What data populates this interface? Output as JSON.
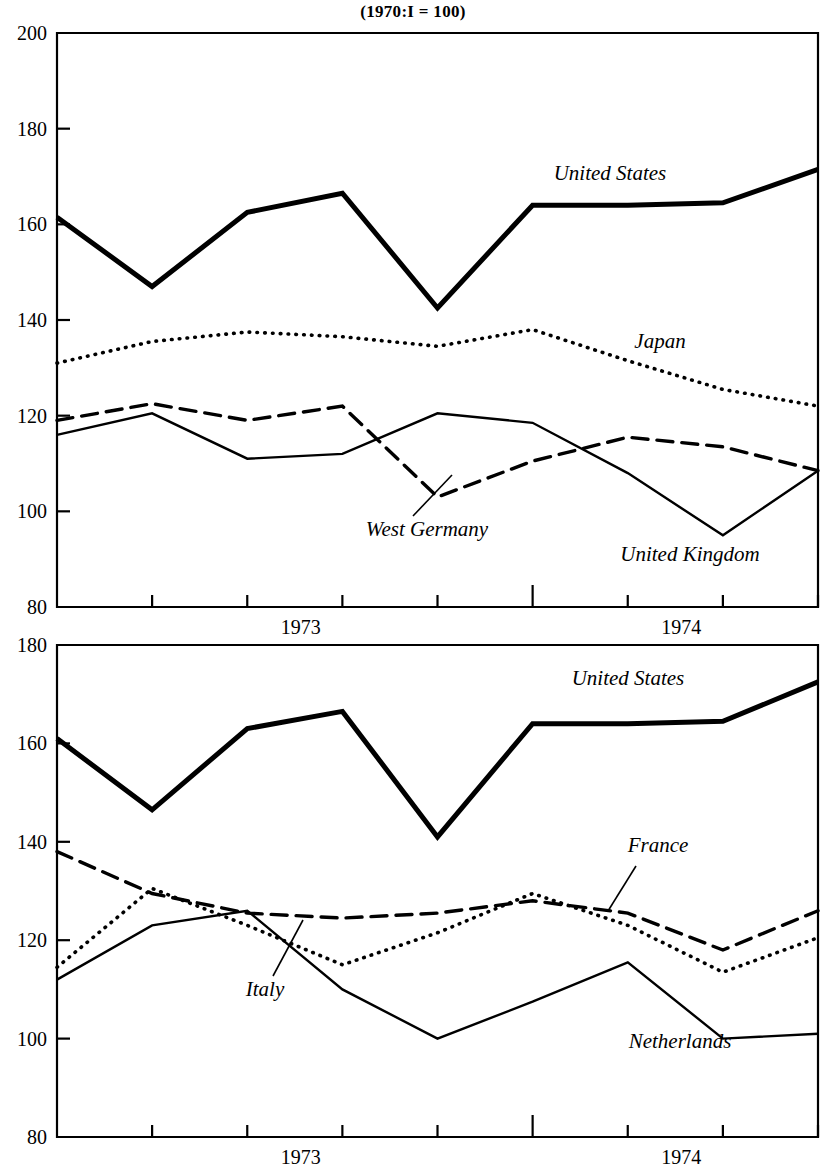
{
  "title": "(1970:I  =  100)",
  "colors": {
    "ink": "#000000",
    "background": "#ffffff"
  },
  "axis": {
    "year_1973": "1973",
    "year_1974": "1974"
  },
  "panels": [
    {
      "name": "top-panel",
      "ylim": [
        80,
        200
      ],
      "yticks": [
        "80",
        "100",
        "120",
        "140",
        "160",
        "180",
        "200"
      ],
      "xticks": [
        "1973",
        "1974"
      ],
      "series_labels": {
        "united_states": "United States",
        "japan": "Japan",
        "west_germany": "West Germany",
        "united_kingdom": "United Kingdom"
      }
    },
    {
      "name": "bottom-panel",
      "ylim": [
        80,
        180
      ],
      "yticks": [
        "80",
        "100",
        "120",
        "140",
        "160",
        "180"
      ],
      "xticks": [
        "1973",
        "1974"
      ],
      "series_labels": {
        "united_states": "United States",
        "france": "France",
        "italy": "Italy",
        "netherlands": "Netherlands"
      }
    }
  ],
  "chart_data": [
    {
      "type": "line",
      "title": "(1970:I  =  100)",
      "subtitle": "Top panel: United States, Japan, West Germany, United Kingdom",
      "xlabel": "",
      "ylabel": "",
      "ylim": [
        80,
        200
      ],
      "yticks": [
        80,
        100,
        120,
        140,
        160,
        180,
        200
      ],
      "grid": false,
      "legend": "inline-annotations",
      "x": [
        "1972:IV",
        "1973:I",
        "1973:II",
        "1973:III",
        "1973:IV",
        "1974:I",
        "1974:II",
        "1974:III",
        "1974:IV"
      ],
      "xtick_labels": [
        "1973",
        "1974"
      ],
      "series": [
        {
          "name": "United States",
          "style": "solid-thick",
          "values": [
            161.5,
            147.0,
            162.5,
            166.5,
            142.5,
            164.0,
            164.0,
            164.5,
            171.5
          ]
        },
        {
          "name": "Japan",
          "style": "dotted",
          "values": [
            131.0,
            135.5,
            137.5,
            136.5,
            134.5,
            138.0,
            131.5,
            125.5,
            122.0
          ]
        },
        {
          "name": "West Germany",
          "style": "dashed",
          "values": [
            119.0,
            122.5,
            119.0,
            122.0,
            103.0,
            110.5,
            115.5,
            113.5,
            108.5
          ]
        },
        {
          "name": "United Kingdom",
          "style": "solid-thin",
          "values": [
            116.0,
            120.5,
            111.0,
            112.0,
            120.5,
            118.5,
            108.0,
            95.0,
            108.5
          ]
        }
      ]
    },
    {
      "type": "line",
      "title": "",
      "subtitle": "Bottom panel: United States, France, Italy, Netherlands",
      "xlabel": "",
      "ylabel": "",
      "ylim": [
        80,
        180
      ],
      "yticks": [
        80,
        100,
        120,
        140,
        160,
        180
      ],
      "grid": false,
      "legend": "inline-annotations",
      "x": [
        "1972:IV",
        "1973:I",
        "1973:II",
        "1973:III",
        "1973:IV",
        "1974:I",
        "1974:II",
        "1974:III",
        "1974:IV"
      ],
      "xtick_labels": [
        "1973",
        "1974"
      ],
      "series": [
        {
          "name": "United States",
          "style": "solid-thick",
          "values": [
            161.0,
            146.5,
            163.0,
            166.5,
            141.0,
            164.0,
            164.0,
            164.5,
            172.5
          ]
        },
        {
          "name": "France",
          "style": "dashed",
          "values": [
            138.0,
            129.5,
            125.5,
            124.5,
            125.5,
            128.0,
            125.5,
            118.0,
            126.0
          ]
        },
        {
          "name": "Italy",
          "style": "dotted",
          "values": [
            114.5,
            130.5,
            123.0,
            115.0,
            121.5,
            129.5,
            123.0,
            113.5,
            120.5
          ]
        },
        {
          "name": "Netherlands",
          "style": "solid-thin",
          "values": [
            112.0,
            123.0,
            126.0,
            110.0,
            100.0,
            107.5,
            115.5,
            100.0,
            101.0
          ]
        }
      ]
    }
  ]
}
